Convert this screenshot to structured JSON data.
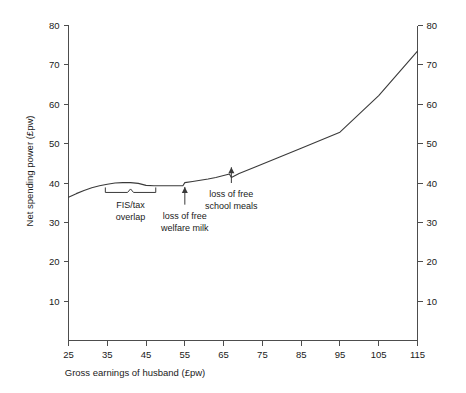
{
  "chart_data": {
    "type": "line",
    "title": "",
    "xlabel": "Gross earnings of husband (£pw)",
    "ylabel": "Net spending power (£pw)",
    "ylabel_right": "",
    "xlim": [
      25,
      115
    ],
    "ylim": [
      0,
      80
    ],
    "xticks": [
      25,
      35,
      45,
      55,
      65,
      75,
      85,
      95,
      105,
      115
    ],
    "xtick_labels": [
      "25",
      "35",
      "45",
      "55",
      "65",
      "75",
      "85",
      "95",
      "105",
      "115"
    ],
    "yticks": [
      10,
      20,
      30,
      40,
      50,
      60,
      70,
      80
    ],
    "ytick_labels": [
      "10",
      "20",
      "30",
      "40",
      "50",
      "60",
      "70",
      "80"
    ],
    "yticks_right": [
      10,
      20,
      30,
      40,
      50,
      60,
      70,
      80
    ],
    "ytick_labels_right": [
      "10",
      "20",
      "30",
      "40",
      "50",
      "60",
      "70",
      "80"
    ],
    "grid": false,
    "legend": false,
    "line_color": "#3a3a3a",
    "axis_color": "#4d4d4d",
    "series": [
      {
        "name": "Net spending power",
        "x": [
          25,
          27,
          29,
          31,
          33,
          35,
          37,
          39,
          41,
          43,
          45,
          47,
          49,
          51,
          53,
          54.5,
          55,
          57,
          59,
          61,
          63,
          65,
          66.5,
          67,
          69,
          73,
          79,
          85,
          95,
          105,
          115
        ],
        "y": [
          36.4,
          37.3,
          38.1,
          38.8,
          39.3,
          39.7,
          40.0,
          40.1,
          40.1,
          39.9,
          39.4,
          39.3,
          39.3,
          39.3,
          39.3,
          39.3,
          40.1,
          40.4,
          40.7,
          41.0,
          41.4,
          41.9,
          42.3,
          41.4,
          42.4,
          44.0,
          46.4,
          48.8,
          52.9,
          62.2,
          73.5
        ]
      }
    ],
    "annotations": [
      {
        "id": "fis-tax-overlap",
        "kind": "bracket",
        "lines": [
          "FIS/tax",
          "overlap"
        ],
        "x_start": 34.5,
        "x_end": 47.5,
        "y": 37.6
      },
      {
        "id": "loss-free-welfare-milk",
        "kind": "arrow",
        "lines": [
          "loss of free",
          "welfare milk"
        ],
        "x": 55,
        "y_tip": 39.0,
        "y_tail": 34.5
      },
      {
        "id": "loss-free-school-meals",
        "kind": "arrow",
        "lines": [
          "loss of free",
          "school meals"
        ],
        "x": 67,
        "y_tip": 44.0,
        "y_tail": 40.0
      }
    ]
  }
}
